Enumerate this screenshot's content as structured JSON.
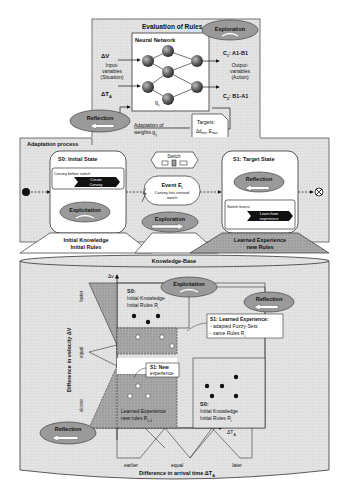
{
  "evaluation": {
    "title": "Evaluation of Rules",
    "nn_title": "Neural Network",
    "input_dv": "ΔV",
    "input_label_1": "Input-",
    "input_label_2": "variables",
    "input_label_3": "(Situation)",
    "input_dta": "ΔT",
    "input_dta_sub": "A",
    "weight": "g",
    "weight_sub": "ij",
    "output_c1": "C",
    "output_c1_sub": "1",
    "output_c1_val": ": A1-B1",
    "output_c2": "C",
    "output_c2_sub": "2",
    "output_c2_val": ": B1-A1",
    "output_label_1": "Output-",
    "output_label_2": "variables",
    "output_label_3": "(Action)",
    "exploration": "Exploration",
    "reflection": "Reflection",
    "adaptation_1": "Adaptation of",
    "adaptation_2": "weights g",
    "adaptation_sub": "ij",
    "targets_1": "Targets:",
    "targets_2": "Δd",
    "targets_2_sub": "min",
    "targets_3": ", E",
    "targets_3_sub": "max"
  },
  "adaptation": {
    "title": "Adaptation process",
    "s0": {
      "title": "S0: Initial State",
      "sub": "Convey before switch",
      "action_1": "Create",
      "action_2": "Convey",
      "exploitation": "Exploitation",
      "knowledge_1": "Initial Knowledge",
      "knowledge_2": "Initial Rules"
    },
    "switch": "Switch",
    "event": {
      "title": "Event E",
      "title_sub": "i",
      "desc_1": "Convey has crossed",
      "desc_2": "switch"
    },
    "exploration": "Exploration",
    "s1": {
      "title": "S1: Target State",
      "reflection": "Reflection",
      "sub": "Switch learns",
      "action_1": "Learn from",
      "action_2": "experience",
      "knowledge_1": "Learned  Experience",
      "knowledge_2": "new Rules"
    }
  },
  "knowledge_base": {
    "title": "Knowledge-Base",
    "y_axis": "Difference in velocity ΔV",
    "y_axis_symbol": "Δv",
    "y_ticks": [
      "faster",
      "equal",
      "slower"
    ],
    "x_axis": "Difference in arrival time ΔT",
    "x_axis_sub": "A",
    "x_axis_symbol": "ΔT",
    "x_axis_symbol_sub": "A",
    "x_ticks": [
      "earlier",
      "equal",
      "later"
    ],
    "exploitation": "Exploitation",
    "reflection_upper": "Reflection",
    "reflection_lower": "Reflection",
    "s0_upper": {
      "title": "S0:",
      "line1": "Initial Knowledge",
      "line2": "Initial Rules R",
      "line2_sub": "i"
    },
    "s1_learned": {
      "title": "S1: Learned Experience:",
      "line1": "-  adapted Fuzzy-Sets",
      "line2": "-  same Rules R",
      "line2_sub": "i"
    },
    "s1_new": {
      "title": "S1: New",
      "line1": "experience"
    },
    "learned_lower": {
      "line1": "Learned Experience",
      "line2": "new rules  R",
      "line2_sub": "i+1"
    },
    "s0_lower": {
      "title": "S0:",
      "line1": "Initial Knowledge",
      "line2": "Initial Rules R",
      "line2_sub": "i"
    }
  }
}
